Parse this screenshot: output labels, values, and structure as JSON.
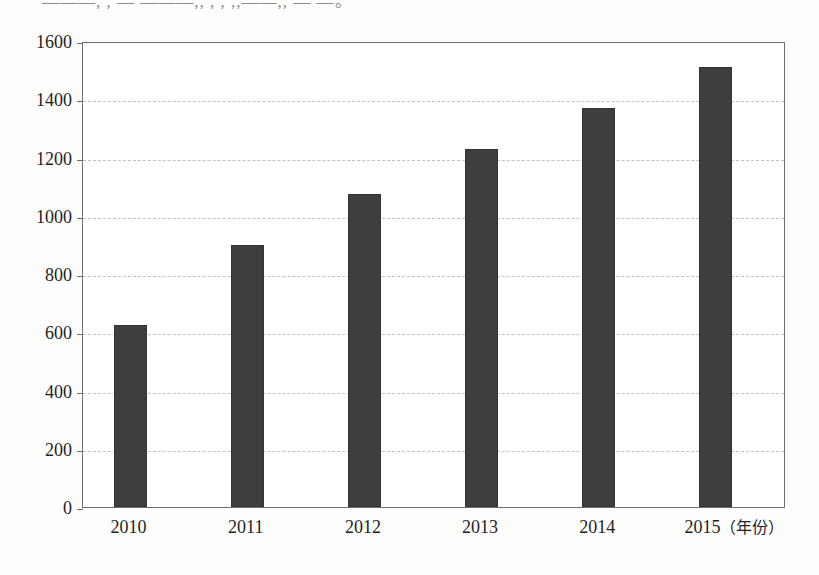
{
  "page": {
    "clipped_header_text": "———, , — ———,,  ,           ,  ,,——,,  —  —。"
  },
  "chart_data": {
    "type": "bar",
    "title": "",
    "subtitle": "",
    "xlabel": "(年份)",
    "ylabel": "",
    "categories": [
      "2010",
      "2011",
      "2012",
      "2013",
      "2014",
      "2015"
    ],
    "values": [
      625,
      900,
      1075,
      1230,
      1370,
      1510
    ],
    "series": [
      {
        "name": "",
        "values": [
          625,
          900,
          1075,
          1230,
          1370,
          1510
        ]
      }
    ],
    "ylim": [
      0,
      1600
    ],
    "ytick_labels": [
      "0",
      "200",
      "400",
      "600",
      "800",
      "1000",
      "1200",
      "1400",
      "1600"
    ],
    "ytick_values": [
      0,
      200,
      400,
      600,
      800,
      1000,
      1200,
      1400,
      1600
    ],
    "xtick_labels": [
      "2010",
      "2011",
      "2012",
      "2013",
      "2014",
      "2015"
    ],
    "xtick_last_suffix": "（年份）",
    "grid": true,
    "grid_axis": "y",
    "legend": null,
    "legend_position": "none",
    "bar_color": "#3e3e3e",
    "grid_color": "#c2c2c2",
    "frame_color": "#6f6f6f",
    "background_color": "#ffffff",
    "annotations": []
  }
}
